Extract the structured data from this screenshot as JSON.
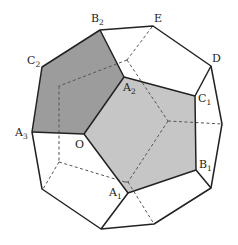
{
  "figure": {
    "type": "dodecahedron-projection",
    "colors": {
      "dark_face": "#9a9a9a",
      "light_face": "#c4c4c4",
      "edge": "#222222",
      "hidden_edge": "#555555"
    }
  },
  "labels": {
    "B2": {
      "base": "B",
      "sub": "2"
    },
    "E": {
      "base": "E",
      "sub": ""
    },
    "D": {
      "base": "D",
      "sub": ""
    },
    "C2": {
      "base": "C",
      "sub": "2"
    },
    "A2": {
      "base": "A",
      "sub": "2"
    },
    "C1": {
      "base": "C",
      "sub": "1"
    },
    "A3": {
      "base": "A",
      "sub": "3"
    },
    "O": {
      "base": "O",
      "sub": ""
    },
    "B1": {
      "base": "B",
      "sub": "1"
    },
    "A1": {
      "base": "A",
      "sub": "1"
    }
  }
}
